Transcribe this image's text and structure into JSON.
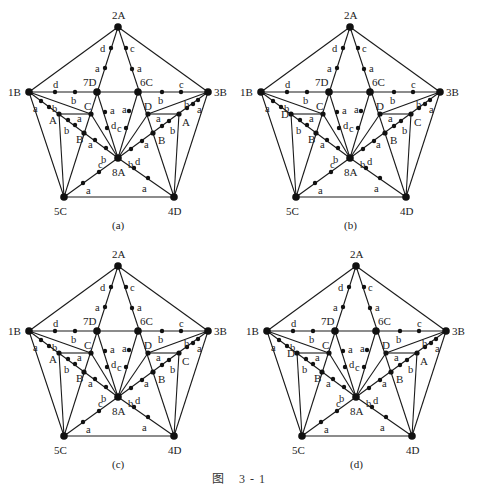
{
  "figure": {
    "caption_prefix": "图",
    "caption_number": "3 - 1"
  },
  "base_geometry": {
    "nodes": {
      "2A": [
        118,
        27
      ],
      "1B": [
        29,
        92
      ],
      "3B": [
        208,
        92
      ],
      "7D": [
        97,
        92
      ],
      "6C": [
        138,
        92
      ],
      "8A": [
        118,
        158
      ],
      "5C": [
        64,
        197
      ],
      "4D": [
        174,
        197
      ],
      "L1": [
        59,
        114
      ],
      "LC": [
        91,
        114
      ],
      "LB": [
        84,
        133
      ],
      "RD": [
        148,
        114
      ],
      "R2": [
        179,
        114
      ],
      "RB": [
        153,
        133
      ]
    },
    "big_nodes": [
      "2A",
      "1B",
      "3B",
      "7D",
      "6C",
      "8A",
      "5C",
      "4D"
    ],
    "mid_nodes": [
      "L1",
      "LC",
      "LB",
      "RD",
      "R2",
      "RB"
    ],
    "edges": [
      [
        "2A",
        "1B"
      ],
      [
        "2A",
        "3B"
      ],
      [
        "1B",
        "5C"
      ],
      [
        "3B",
        "4D"
      ],
      [
        "5C",
        "4D"
      ],
      [
        "1B",
        "3B"
      ],
      [
        "2A",
        "5C"
      ],
      [
        "2A",
        "4D"
      ],
      [
        "1B",
        "8A"
      ],
      [
        "3B",
        "8A"
      ],
      [
        "1B",
        "LC"
      ],
      [
        "LC",
        "8A"
      ],
      [
        "3B",
        "RD"
      ],
      [
        "RD",
        "8A"
      ],
      [
        "7D",
        "8A"
      ],
      [
        "6C",
        "8A"
      ],
      [
        "5C",
        "8A"
      ],
      [
        "4D",
        "8A"
      ],
      [
        "L1",
        "LC"
      ],
      [
        "L1",
        "5C"
      ],
      [
        "RD",
        "R2"
      ],
      [
        "R2",
        "4D"
      ]
    ],
    "small_dots": [
      [
        111,
        48
      ],
      [
        105,
        68
      ],
      [
        126,
        48
      ],
      [
        132,
        69
      ],
      [
        55,
        92
      ],
      [
        75,
        92
      ],
      [
        162,
        92
      ],
      [
        181,
        92
      ],
      [
        41,
        101
      ],
      [
        49,
        107
      ],
      [
        68,
        120
      ],
      [
        75,
        125
      ],
      [
        95,
        140
      ],
      [
        106,
        148
      ],
      [
        198,
        100
      ],
      [
        193,
        104
      ],
      [
        187,
        108
      ],
      [
        169,
        121
      ],
      [
        162,
        126
      ],
      [
        142,
        141
      ],
      [
        131,
        149
      ],
      [
        105,
        112
      ],
      [
        107,
        128
      ],
      [
        129,
        111
      ],
      [
        126,
        128
      ],
      [
        99,
        172
      ],
      [
        83,
        183
      ],
      [
        134,
        168
      ],
      [
        148,
        178
      ]
    ],
    "node_labels": [
      {
        "text": "2A",
        "x": 112,
        "y": 19
      },
      {
        "text": "1B",
        "x": 8,
        "y": 96
      },
      {
        "text": "3B",
        "x": 214,
        "y": 96
      },
      {
        "text": "7D",
        "x": 83,
        "y": 86
      },
      {
        "text": "6C",
        "x": 140,
        "y": 86
      },
      {
        "text": "8A",
        "x": 112,
        "y": 176
      },
      {
        "text": "5C",
        "x": 54,
        "y": 215
      },
      {
        "text": "4D",
        "x": 168,
        "y": 215
      }
    ],
    "edge_labels": [
      {
        "text": "d",
        "x": 100,
        "y": 52
      },
      {
        "text": "a",
        "x": 95,
        "y": 72
      },
      {
        "text": "c",
        "x": 130,
        "y": 52
      },
      {
        "text": "a",
        "x": 137,
        "y": 72
      },
      {
        "text": "d",
        "x": 53,
        "y": 88
      },
      {
        "text": "b",
        "x": 71,
        "y": 104
      },
      {
        "text": "c",
        "x": 179,
        "y": 88
      },
      {
        "text": "b",
        "x": 158,
        "y": 104
      },
      {
        "text": "a",
        "x": 33,
        "y": 112
      },
      {
        "text": "b",
        "x": 52,
        "y": 112
      },
      {
        "text": "a",
        "x": 77,
        "y": 122
      },
      {
        "text": "b",
        "x": 64,
        "y": 134
      },
      {
        "text": "a",
        "x": 88,
        "y": 148
      },
      {
        "text": "b",
        "x": 101,
        "y": 163
      },
      {
        "text": "a",
        "x": 110,
        "y": 114
      },
      {
        "text": "d",
        "x": 111,
        "y": 129
      },
      {
        "text": "a",
        "x": 122,
        "y": 113
      },
      {
        "text": "c",
        "x": 117,
        "y": 132
      },
      {
        "text": "a",
        "x": 156,
        "y": 122
      },
      {
        "text": "b",
        "x": 170,
        "y": 134
      },
      {
        "text": "a",
        "x": 144,
        "y": 148
      },
      {
        "text": "b",
        "x": 184,
        "y": 108
      },
      {
        "text": "a",
        "x": 197,
        "y": 113
      },
      {
        "text": "c",
        "x": 98,
        "y": 168
      },
      {
        "text": "a",
        "x": 86,
        "y": 194
      },
      {
        "text": "b",
        "x": 128,
        "y": 168
      },
      {
        "text": "d",
        "x": 135,
        "y": 165
      },
      {
        "text": "a",
        "x": 142,
        "y": 192
      }
    ]
  },
  "panels": [
    {
      "id": "a",
      "subcaption": "(a)",
      "offset": [
        0,
        0
      ],
      "inner_labels": {
        "L1": {
          "text": "A",
          "x": 49,
          "y": 124
        },
        "LC": {
          "text": "C",
          "x": 84,
          "y": 110
        },
        "LB": {
          "text": "B",
          "x": 76,
          "y": 143
        },
        "RD": {
          "text": "D",
          "x": 144,
          "y": 110
        },
        "R2": {
          "text": "A",
          "x": 182,
          "y": 126
        },
        "RB": {
          "text": "B",
          "x": 158,
          "y": 144
        }
      }
    },
    {
      "id": "b",
      "subcaption": "(b)",
      "offset": [
        232,
        0
      ],
      "inner_labels": {
        "L1": {
          "text": "D",
          "x": 49,
          "y": 118
        },
        "LC": {
          "text": "C",
          "x": 84,
          "y": 110
        },
        "LB": {
          "text": "B",
          "x": 76,
          "y": 143
        },
        "RD": {
          "text": "D",
          "x": 144,
          "y": 110
        },
        "R2": {
          "text": "C",
          "x": 182,
          "y": 126
        },
        "RB": {
          "text": "B",
          "x": 158,
          "y": 144
        }
      }
    },
    {
      "id": "c",
      "subcaption": "(c)",
      "offset": [
        0,
        239
      ],
      "inner_labels": {
        "L1": {
          "text": "A",
          "x": 49,
          "y": 124
        },
        "LC": {
          "text": "C",
          "x": 84,
          "y": 110
        },
        "LB": {
          "text": "B",
          "x": 76,
          "y": 143
        },
        "RD": {
          "text": "D",
          "x": 144,
          "y": 110
        },
        "R2": {
          "text": "C",
          "x": 182,
          "y": 126
        },
        "RB": {
          "text": "B",
          "x": 158,
          "y": 144
        }
      }
    },
    {
      "id": "d",
      "subcaption": "(d)",
      "offset": [
        238,
        239
      ],
      "inner_labels": {
        "L1": {
          "text": "D",
          "x": 49,
          "y": 118
        },
        "LC": {
          "text": "C",
          "x": 84,
          "y": 110
        },
        "LB": {
          "text": "B",
          "x": 76,
          "y": 143
        },
        "RD": {
          "text": "D",
          "x": 144,
          "y": 110
        },
        "R2": {
          "text": "A",
          "x": 182,
          "y": 126
        },
        "RB": {
          "text": "B",
          "x": 158,
          "y": 144
        }
      }
    }
  ],
  "subcaption_position": [
    112,
    229
  ]
}
